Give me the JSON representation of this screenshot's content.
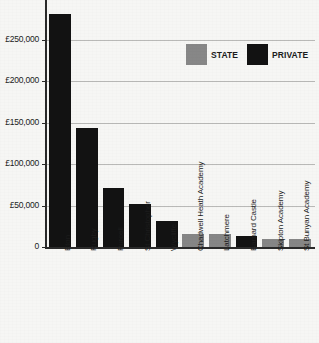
{
  "chart_data": {
    "type": "bar",
    "title": "",
    "xlabel": "",
    "ylabel": "",
    "ylim": [
      0,
      290000
    ],
    "grid": true,
    "legend_position": "top-right",
    "categories": [
      "Eton",
      "Rugby",
      "Purcell",
      "St Christopher",
      "Wycliffe",
      "Chadwell Heath Academy",
      "Latchmere",
      "Barnard Castle",
      "Skipton Academy",
      "St Bunyan Academy"
    ],
    "values": [
      282000,
      144000,
      71000,
      52000,
      32000,
      16000,
      16000,
      13000,
      10000,
      10000
    ],
    "sectors": [
      "private",
      "private",
      "private",
      "private",
      "private",
      "state",
      "state",
      "private",
      "state",
      "state"
    ],
    "yticks": [
      0,
      50000,
      100000,
      150000,
      200000,
      250000
    ],
    "ytick_labels": [
      "0",
      "£50,000",
      "£100,000",
      "£150,000",
      "£200,000",
      "£250,000"
    ],
    "legend": [
      {
        "label": "STATE",
        "key": "state",
        "color": "#878787"
      },
      {
        "label": "PRIVATE",
        "key": "private",
        "color": "#121212"
      }
    ],
    "colors": {
      "state": "#878787",
      "private": "#121212",
      "background": "#f6f6f4",
      "gridline": "#b9b9b7",
      "axis": "#2a2a2a",
      "text": "#1c1c1c"
    }
  }
}
